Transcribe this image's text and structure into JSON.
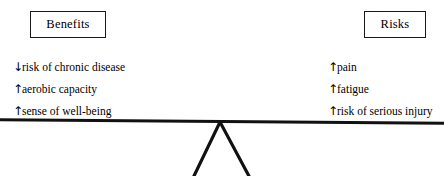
{
  "diagram": {
    "beam": {
      "name": "balance-beam",
      "tilt_degrees": 0.42,
      "color": "#111111"
    },
    "fulcrum": {
      "name": "fulcrum-triangle",
      "apex_x": 220,
      "color": "#111111"
    }
  },
  "left_side": {
    "heading": "Benefits",
    "items": [
      {
        "arrow": "↓",
        "arrow_name": "down-arrow-icon",
        "text": "risk of chronic disease"
      },
      {
        "arrow": "↑",
        "arrow_name": "up-arrow-icon",
        "text": "aerobic capacity"
      },
      {
        "arrow": "↑",
        "arrow_name": "up-arrow-icon",
        "text": "sense of well-being"
      }
    ]
  },
  "right_side": {
    "heading": "Risks",
    "items": [
      {
        "arrow": "↑",
        "arrow_name": "up-arrow-icon",
        "text": "pain"
      },
      {
        "arrow": "↑",
        "arrow_name": "up-arrow-icon",
        "text": "fatigue"
      },
      {
        "arrow": "↑",
        "arrow_name": "up-arrow-icon",
        "text": "risk of serious injury"
      }
    ]
  },
  "colors": {
    "ink": "#000000",
    "line": "#111111",
    "background": "#ffffff"
  }
}
